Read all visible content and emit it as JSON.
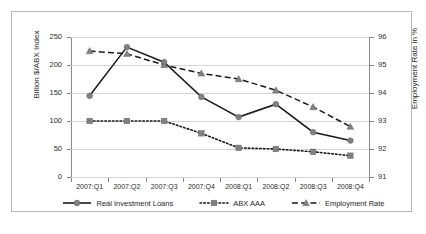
{
  "chart_data": {
    "type": "line",
    "title": "",
    "xlabel": "",
    "ylabel": "Billion $/ABX Index",
    "y2label": "Employment Rate in %",
    "categories": [
      "2007:Q1",
      "2007:Q2",
      "2007:Q3",
      "2007:Q4",
      "2008:Q1",
      "2008:Q2",
      "2008:Q3",
      "2008:Q4"
    ],
    "ylim": [
      0,
      250
    ],
    "yticks": [
      0,
      50,
      100,
      150,
      200,
      250
    ],
    "y2lim": [
      91,
      96
    ],
    "y2ticks": [
      91,
      92,
      93,
      94,
      95,
      96
    ],
    "grid": true,
    "legend_position": "bottom",
    "series": [
      {
        "name": "Real Investment Loans",
        "axis": "left",
        "marker": "circle",
        "linestyle": "solid",
        "color": "#1a1a1a",
        "marker_color": "#808080",
        "values": [
          145,
          232,
          205,
          143,
          107,
          130,
          80,
          65
        ]
      },
      {
        "name": "ABX AAA",
        "axis": "left",
        "marker": "square",
        "linestyle": "dotted",
        "color": "#1a1a1a",
        "marker_color": "#808080",
        "values": [
          100,
          100,
          100,
          78,
          52,
          50,
          45,
          38
        ]
      },
      {
        "name": "Employment Rate",
        "axis": "right",
        "marker": "triangle",
        "linestyle": "dashed",
        "color": "#1a1a1a",
        "marker_color": "#808080",
        "values": [
          95.5,
          95.4,
          95.0,
          94.7,
          94.5,
          94.1,
          93.5,
          92.8
        ]
      }
    ]
  },
  "axes": {
    "left_title": "Billion $/ABX Index",
    "right_title": "Employment Rate in %",
    "left_ticks": [
      "250",
      "200",
      "150",
      "100",
      "50",
      "0"
    ],
    "right_ticks": [
      "96",
      "95",
      "94",
      "93",
      "92",
      "91"
    ],
    "x_ticks": [
      "2007:Q1",
      "2007:Q2",
      "2007:Q3",
      "2007:Q4",
      "2008:Q1",
      "2008:Q2",
      "2008:Q3",
      "2008:Q4"
    ]
  },
  "legend": {
    "items": [
      {
        "label": "Real Investment Loans",
        "icon": "solid-line-circle-marker"
      },
      {
        "label": "ABX AAA",
        "icon": "dotted-line-square-marker"
      },
      {
        "label": "Employment Rate",
        "icon": "dashed-line-triangle-marker"
      }
    ]
  }
}
